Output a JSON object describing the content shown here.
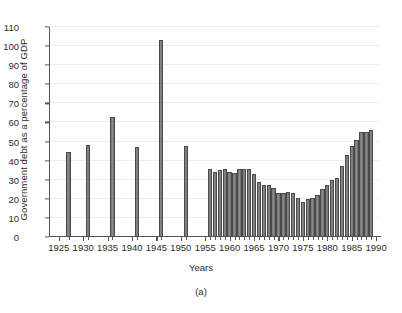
{
  "chart_data": {
    "type": "bar",
    "title": "",
    "subtitle": "",
    "caption": "(a)",
    "xlabel": "Years",
    "ylabel": "Government debt as a percentage of GDP",
    "xlim": [
      1923,
      1991
    ],
    "ylim": [
      0,
      110
    ],
    "ytick_step": 10,
    "xtick_step": 5,
    "grid": true,
    "grid_axis": "y",
    "legend": "none",
    "bar_color": "#7c7c7c",
    "bar_edge_color": "#4a4a4a",
    "ytick_labels": [
      "0",
      "10",
      "20",
      "30",
      "40",
      "50",
      "60",
      "70",
      "80",
      "90",
      "100",
      "110"
    ],
    "xtick_labels": [
      "1925",
      "1930",
      "1935",
      "1940",
      "1945",
      "1950",
      "1955",
      "1960",
      "1965",
      "1970",
      "1975",
      "1980",
      "1985",
      "1990"
    ],
    "note": "Isolated bars at 5-year intervals 1927-1951, then annual bars 1956-1989",
    "x": [
      1927,
      1931,
      1936,
      1941,
      1946,
      1951,
      1956,
      1957,
      1958,
      1959,
      1960,
      1961,
      1962,
      1963,
      1964,
      1965,
      1966,
      1967,
      1968,
      1969,
      1970,
      1971,
      1972,
      1973,
      1974,
      1975,
      1976,
      1977,
      1978,
      1979,
      1980,
      1981,
      1982,
      1983,
      1984,
      1985,
      1986,
      1987,
      1988,
      1989
    ],
    "values": [
      44.5,
      48,
      63,
      47,
      103,
      47.5,
      35.5,
      34,
      35,
      35.5,
      34,
      33.5,
      35.5,
      35.5,
      35.5,
      33,
      29,
      27.5,
      27,
      25.5,
      23,
      23,
      23.5,
      23,
      20.5,
      18.5,
      20,
      20.5,
      22,
      25,
      27.5,
      30,
      31,
      37,
      43,
      47.5,
      51,
      55,
      55,
      56
    ],
    "categories": [
      "1927",
      "1931",
      "1936",
      "1941",
      "1946",
      "1951",
      "1956",
      "1957",
      "1958",
      "1959",
      "1960",
      "1961",
      "1962",
      "1963",
      "1964",
      "1965",
      "1966",
      "1967",
      "1968",
      "1969",
      "1970",
      "1971",
      "1972",
      "1973",
      "1974",
      "1975",
      "1976",
      "1977",
      "1978",
      "1979",
      "1980",
      "1981",
      "1982",
      "1983",
      "1984",
      "1985",
      "1986",
      "1987",
      "1988",
      "1989"
    ]
  }
}
